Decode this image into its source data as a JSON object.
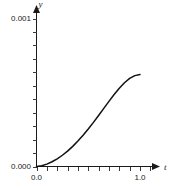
{
  "chart_data": {
    "type": "line",
    "title": "",
    "xlabel": "t",
    "ylabel": "y",
    "xlim": [
      0.0,
      1.15
    ],
    "ylim": [
      0.0,
      0.00108
    ],
    "grid": false,
    "legend": null,
    "x_tick_labels": [
      "0.0",
      "1.0"
    ],
    "y_tick_labels": [
      "0.000",
      "0.001"
    ],
    "x_labeled_ticks": [
      0.0,
      1.0
    ],
    "y_labeled_ticks": [
      0.0,
      0.001
    ],
    "x_minor_tick_count": 10,
    "y_minor_tick_count": 11,
    "series": [
      {
        "name": "y(t)",
        "x": [
          0.0,
          0.05,
          0.1,
          0.15,
          0.2,
          0.25,
          0.3,
          0.35,
          0.4,
          0.45,
          0.5,
          0.55,
          0.6,
          0.65,
          0.7,
          0.75,
          0.8,
          0.85,
          0.9,
          0.95,
          1.0
        ],
        "values": [
          0.0,
          4.5e-06,
          1.6e-05,
          3.2e-05,
          5.2e-05,
          7.6e-05,
          0.000104,
          0.000136,
          0.000172,
          0.000211,
          0.000253,
          0.000298,
          0.000345,
          0.000393,
          0.00044,
          0.000486,
          0.000529,
          0.000566,
          0.000595,
          0.000614,
          0.000622
        ]
      }
    ],
    "colors": {
      "curve": "#111111",
      "axis": "#1a1a1a",
      "tick": "#3a3a3a",
      "background": "#ffffff",
      "text": "#1a1a1a"
    }
  },
  "labels": {
    "y_axis_title": "y",
    "x_axis_title": "t",
    "y_top": "0.001",
    "y_bottom": "0.000",
    "x_left": "0.0",
    "x_right": "1.0"
  }
}
